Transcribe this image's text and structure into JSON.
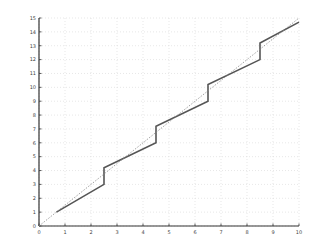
{
  "chart_data": {
    "type": "line",
    "title": "",
    "xlabel": "",
    "ylabel": "",
    "xlim": [
      0,
      10
    ],
    "ylim": [
      0,
      15
    ],
    "grid": true,
    "legend": null,
    "x_ticks": [
      0,
      1,
      2,
      3,
      4,
      5,
      6,
      7,
      8,
      9,
      10
    ],
    "x_tick_labels": [
      "0",
      "1",
      "2",
      "3",
      "4",
      "5",
      "6",
      "7",
      "8",
      "9",
      "10"
    ],
    "y_ticks": [
      0,
      1,
      2,
      3,
      4,
      5,
      6,
      7,
      8,
      9,
      10,
      11,
      12,
      13,
      14,
      15
    ],
    "y_tick_labels": [
      "0",
      "1",
      "2",
      "3",
      "4",
      "5",
      "6",
      "7",
      "8",
      "9",
      "10",
      "11",
      "12",
      "13",
      "14",
      "15"
    ],
    "series": [
      {
        "name": "staircase",
        "style": "solid",
        "color": "#555555",
        "x": [
          0.67,
          2.5,
          2.5,
          4.5,
          4.5,
          6.5,
          6.5,
          8.5,
          8.5,
          10.0
        ],
        "y": [
          1.0,
          3.0,
          4.2,
          6.0,
          7.2,
          9.0,
          10.2,
          12.0,
          13.2,
          14.7
        ]
      },
      {
        "name": "reference",
        "style": "dotted",
        "color": "#888888",
        "x": [
          0,
          10
        ],
        "y": [
          0,
          15
        ]
      }
    ]
  }
}
